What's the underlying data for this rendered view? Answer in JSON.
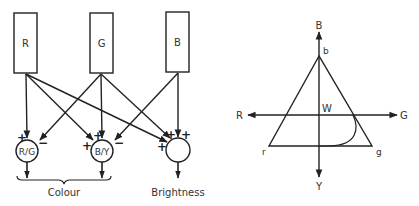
{
  "left_diagram": {
    "receptors": [
      {
        "label": "R"
      },
      {
        "label": "G"
      },
      {
        "label": "B"
      }
    ],
    "channels": [
      {
        "label": "R/G",
        "signs": [
          "+",
          "−"
        ]
      },
      {
        "label": "B/Y",
        "signs": [
          "+",
          "+",
          "−"
        ]
      },
      {
        "label": "",
        "signs": [
          "+",
          "+",
          "+"
        ]
      }
    ],
    "group_labels": {
      "colour": "Colour",
      "brightness": "Brightness"
    }
  },
  "right_diagram": {
    "axis_labels": {
      "top": "B",
      "bottom": "Y",
      "left": "R",
      "right": "G"
    },
    "vertex_labels": {
      "apex": "b",
      "left": "r",
      "right": "g"
    },
    "center_label": "W"
  },
  "colors": {
    "ink": "#222222",
    "background": "#ffffff"
  }
}
